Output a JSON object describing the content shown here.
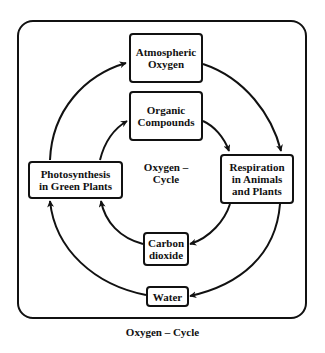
{
  "diagram": {
    "center_label": "Oxygen –\nCycle",
    "caption": "Oxygen – Cycle",
    "nodes": [
      {
        "id": "atmospheric_oxygen",
        "label": "Atmospheric\nOxygen"
      },
      {
        "id": "organic_compounds",
        "label": "Organic\nCompounds"
      },
      {
        "id": "photosynthesis",
        "label": "Photosynthesis\nin Green Plants"
      },
      {
        "id": "respiration",
        "label": "Respiration\nin Animals\nand Plants"
      },
      {
        "id": "carbon_dioxide",
        "label": "Carbon\ndioxide"
      },
      {
        "id": "water",
        "label": "Water"
      }
    ],
    "edges": [
      {
        "from": "photosynthesis",
        "to": "atmospheric_oxygen",
        "ring": "outer"
      },
      {
        "from": "atmospheric_oxygen",
        "to": "respiration",
        "ring": "outer"
      },
      {
        "from": "respiration",
        "to": "water",
        "ring": "outer"
      },
      {
        "from": "water",
        "to": "photosynthesis",
        "ring": "outer"
      },
      {
        "from": "photosynthesis",
        "to": "organic_compounds",
        "ring": "inner"
      },
      {
        "from": "organic_compounds",
        "to": "respiration",
        "ring": "inner"
      },
      {
        "from": "respiration",
        "to": "carbon_dioxide",
        "ring": "inner"
      },
      {
        "from": "carbon_dioxide",
        "to": "photosynthesis",
        "ring": "inner"
      }
    ]
  }
}
